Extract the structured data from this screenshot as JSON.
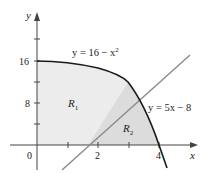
{
  "axes": {
    "x_label": "x",
    "y_label": "y",
    "x_ticks": [
      {
        "value": 0,
        "label": "0"
      },
      {
        "value": 1,
        "label": ""
      },
      {
        "value": 2,
        "label": "2"
      },
      {
        "value": 3,
        "label": ""
      },
      {
        "value": 4,
        "label": "4"
      }
    ],
    "y_ticks": [
      {
        "value": 4,
        "label": ""
      },
      {
        "value": 8,
        "label": "8"
      },
      {
        "value": 12,
        "label": ""
      },
      {
        "value": 16,
        "label": "16"
      },
      {
        "value": 20,
        "label": ""
      }
    ]
  },
  "curves": {
    "parabola": {
      "equation": "y = 16 − x",
      "exponent": "2",
      "color": "#1a1a1a"
    },
    "line": {
      "equation": "y = 5x − 8",
      "color": "#8a8a8a"
    }
  },
  "regions": {
    "r1": {
      "label": "R",
      "subscript": "1",
      "fill": "#ececec"
    },
    "r2": {
      "label": "R",
      "subscript": "2",
      "fill": "#dcdcdc"
    }
  }
}
